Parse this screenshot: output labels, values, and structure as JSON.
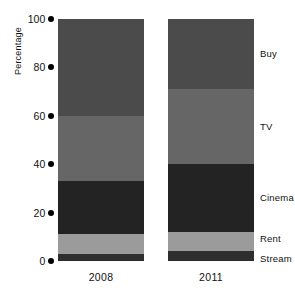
{
  "chart_data": {
    "type": "bar",
    "subtype": "stacked-100-percent",
    "title": "",
    "xlabel": "",
    "ylabel": "Percentage",
    "categories": [
      "2008",
      "2011"
    ],
    "ylim": [
      0,
      100
    ],
    "yticks": [
      0,
      20,
      40,
      60,
      80,
      100
    ],
    "ytick_labels": [
      "0",
      "20",
      "40",
      "60",
      "80",
      "100"
    ],
    "grid": false,
    "legend_position": "right-inline",
    "series": [
      {
        "name": "Stream",
        "values": [
          3,
          4
        ],
        "color": "#2e2e2e"
      },
      {
        "name": "Rent",
        "values": [
          8,
          8
        ],
        "color": "#9b9b9b"
      },
      {
        "name": "Cinema",
        "values": [
          22,
          28
        ],
        "color": "#232323"
      },
      {
        "name": "TV",
        "values": [
          27,
          31
        ],
        "color": "#666666"
      },
      {
        "name": "Buy",
        "values": [
          40,
          29
        ],
        "color": "#4b4b4b"
      }
    ],
    "stack_order_bottom_to_top": [
      "Stream",
      "Rent",
      "Cinema",
      "TV",
      "Buy"
    ],
    "annotations": []
  },
  "axis": {
    "y_title": "Percentage",
    "ticks": [
      {
        "value": 100,
        "label": "100"
      },
      {
        "value": 80,
        "label": "80"
      },
      {
        "value": 60,
        "label": "60"
      },
      {
        "value": 40,
        "label": "40"
      },
      {
        "value": 20,
        "label": "20"
      },
      {
        "value": 0,
        "label": "0"
      }
    ]
  },
  "bars": [
    {
      "category": "2008",
      "segments": [
        {
          "name": "Buy",
          "value": 40,
          "color": "#4b4b4b"
        },
        {
          "name": "TV",
          "value": 27,
          "color": "#666666"
        },
        {
          "name": "Cinema",
          "value": 22,
          "color": "#232323"
        },
        {
          "name": "Rent",
          "value": 8,
          "color": "#9b9b9b"
        },
        {
          "name": "Stream",
          "value": 3,
          "color": "#2e2e2e"
        }
      ]
    },
    {
      "category": "2011",
      "segments": [
        {
          "name": "Buy",
          "value": 29,
          "color": "#4b4b4b"
        },
        {
          "name": "TV",
          "value": 31,
          "color": "#666666"
        },
        {
          "name": "Cinema",
          "value": 28,
          "color": "#232323"
        },
        {
          "name": "Rent",
          "value": 8,
          "color": "#9b9b9b"
        },
        {
          "name": "Stream",
          "value": 4,
          "color": "#2e2e2e"
        }
      ]
    }
  ],
  "series_labels": [
    {
      "label": "Buy"
    },
    {
      "label": "TV"
    },
    {
      "label": "Cinema"
    },
    {
      "label": "Rent"
    },
    {
      "label": "Stream"
    }
  ]
}
